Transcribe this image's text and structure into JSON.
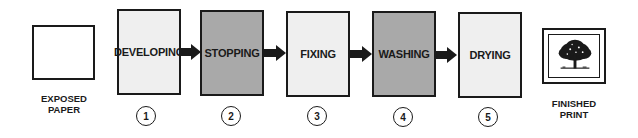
{
  "diagram": {
    "start": {
      "label_line1": "EXPOSED",
      "label_line2": "PAPER"
    },
    "end": {
      "label_line1": "FINISHED",
      "label_line2": "PRINT",
      "icon": "framed-tree-picture-icon"
    },
    "steps": [
      {
        "number": "1",
        "label": "DEVELOPING",
        "fill": "#efefef"
      },
      {
        "number": "2",
        "label": "STOPPING",
        "fill": "#a9a9a9"
      },
      {
        "number": "3",
        "label": "FIXING",
        "fill": "#efefef"
      },
      {
        "number": "4",
        "label": "WASHING",
        "fill": "#a9a9a9"
      },
      {
        "number": "5",
        "label": "DRYING",
        "fill": "#efefef"
      }
    ],
    "colors": {
      "stroke": "#1a1a1a",
      "light_fill": "#efefef",
      "dark_fill": "#a9a9a9",
      "background": "#ffffff"
    }
  }
}
